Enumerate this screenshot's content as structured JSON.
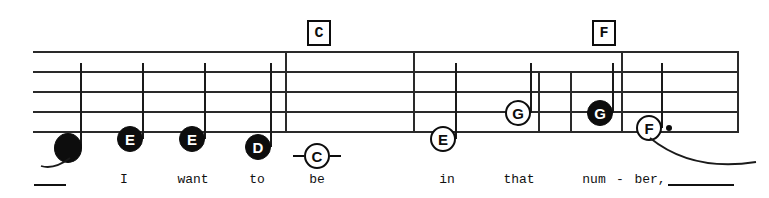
{
  "staff": {
    "line_count": 5,
    "left": 33,
    "right": 737,
    "top": 51,
    "height": 82,
    "color": "#2a2a2a"
  },
  "chords": [
    {
      "label": "C",
      "x": 317
    },
    {
      "label": "F",
      "x": 602
    }
  ],
  "notes": [
    {
      "id": "note-1",
      "letter": "",
      "style": "filled-blank",
      "x": 68,
      "y": 148,
      "stem": true,
      "stem_dir": "up"
    },
    {
      "id": "note-2",
      "letter": "E",
      "style": "filled",
      "x": 130,
      "y": 139,
      "stem": true,
      "stem_dir": "up"
    },
    {
      "id": "note-3",
      "letter": "E",
      "style": "filled",
      "x": 192,
      "y": 139,
      "stem": true,
      "stem_dir": "up"
    },
    {
      "id": "note-4",
      "letter": "D",
      "style": "filled",
      "x": 258,
      "y": 147,
      "stem": true,
      "stem_dir": "up"
    },
    {
      "id": "note-5",
      "letter": "C",
      "style": "open",
      "x": 317,
      "y": 156,
      "stem": false,
      "sustain": true
    },
    {
      "id": "note-6",
      "letter": "E",
      "style": "open",
      "x": 443,
      "y": 139,
      "stem": true,
      "stem_dir": "up"
    },
    {
      "id": "note-7",
      "letter": "G",
      "style": "open",
      "x": 518,
      "y": 113,
      "stem": true,
      "stem_dir": "up"
    },
    {
      "id": "note-8",
      "letter": "G",
      "style": "filled",
      "x": 600,
      "y": 113,
      "stem": true,
      "stem_dir": "up"
    },
    {
      "id": "note-9",
      "letter": "F",
      "style": "open",
      "x": 649,
      "y": 128,
      "stem": true,
      "stem_dir": "up",
      "dotted": true
    }
  ],
  "barlines": [
    {
      "x": 285,
      "full": true
    },
    {
      "x": 413,
      "full": true
    },
    {
      "x": 538,
      "full": false
    },
    {
      "x": 570,
      "full": false
    },
    {
      "x": 621,
      "full": true
    },
    {
      "x": 737,
      "full": true
    }
  ],
  "lyrics": [
    {
      "text": "I",
      "x": 124
    },
    {
      "text": "want",
      "x": 193
    },
    {
      "text": "to",
      "x": 257
    },
    {
      "text": "be",
      "x": 317
    },
    {
      "text": "in",
      "x": 447
    },
    {
      "text": "that",
      "x": 519
    },
    {
      "text": "num",
      "x": 594
    },
    {
      "text": "-",
      "x": 620
    },
    {
      "text": "ber,",
      "x": 650
    }
  ],
  "melismas": [
    {
      "x": 34,
      "width": 32
    },
    {
      "x": 668,
      "width": 66
    }
  ],
  "colors": {
    "ink": "#0d0d0d",
    "staff": "#2a2a2a",
    "paper": "#ffffff"
  }
}
